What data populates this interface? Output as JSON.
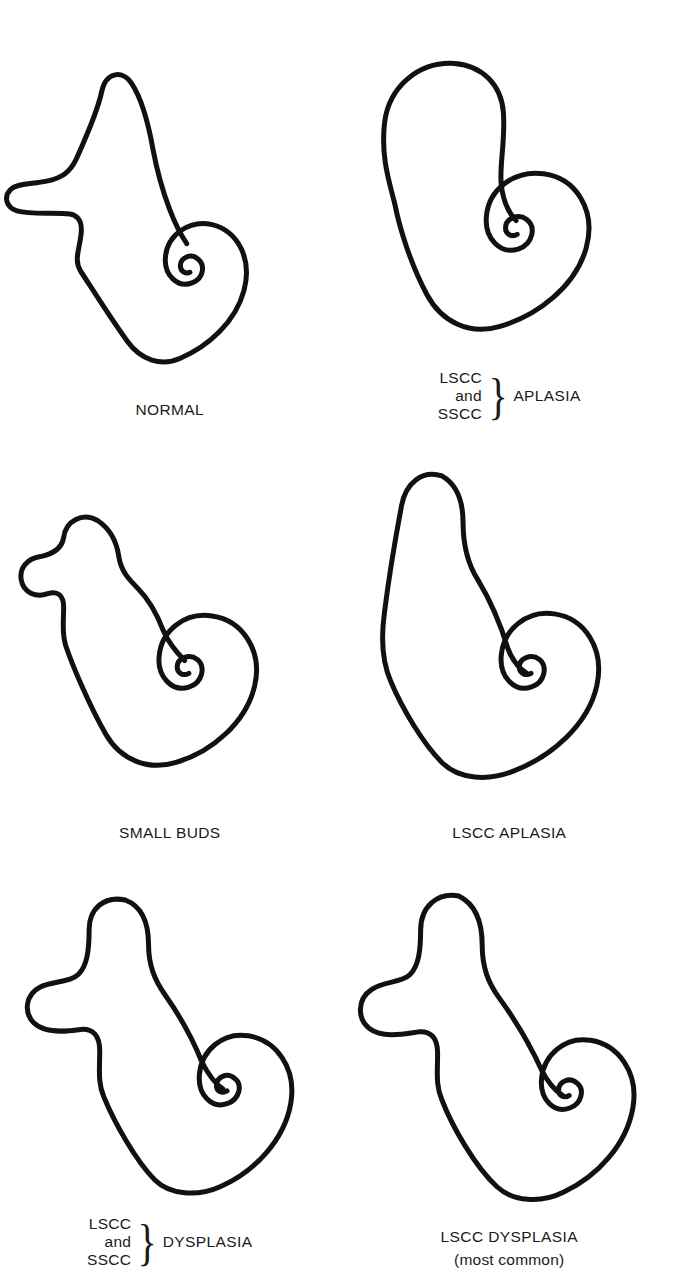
{
  "figure": {
    "type": "medical-anatomy-diagram",
    "background_color": "#ffffff",
    "line_color": "#111111",
    "columns": 2,
    "rows": 3
  },
  "panels": [
    {
      "id": "normal",
      "row": 1,
      "column": 1,
      "caption_style": "simple",
      "caption": "NORMAL",
      "features": {
        "sscc": "present, long vertical canal",
        "lscc": "present, long horizontal canal",
        "cochlea": "normal spiral, 2.5 turns"
      }
    },
    {
      "id": "lscc-sscc-aplasia",
      "row": 1,
      "column": 2,
      "caption_style": "braced",
      "brace_lines": [
        "LSCC",
        "and",
        "SSCC"
      ],
      "brace_glyph": "}",
      "brace_term": "APLASIA",
      "features": {
        "sscc": "absent",
        "lscc": "absent",
        "cochlea": "normal spiral, 2.5 turns"
      }
    },
    {
      "id": "small-buds",
      "row": 2,
      "column": 1,
      "caption_style": "simple",
      "caption": "SMALL BUDS",
      "features": {
        "sscc": "small bud only",
        "lscc": "small bud only",
        "cochlea": "normal spiral, 2.5 turns"
      }
    },
    {
      "id": "lscc-aplasia",
      "row": 2,
      "column": 2,
      "caption_style": "simple",
      "caption": "LSCC APLASIA",
      "features": {
        "sscc": "present, long vertical canal",
        "lscc": "absent",
        "cochlea": "normal spiral, 2.5 turns"
      }
    },
    {
      "id": "lscc-sscc-dysplasia",
      "row": 3,
      "column": 1,
      "caption_style": "braced",
      "brace_lines": [
        "LSCC",
        "and",
        "SSCC"
      ],
      "brace_glyph": "}",
      "brace_term": "DYSPLASIA",
      "features": {
        "sscc": "short, blunt, dysplastic",
        "lscc": "short, blunt, dysplastic",
        "cochlea": "normal spiral, 2.5 turns"
      }
    },
    {
      "id": "lscc-dysplasia",
      "row": 3,
      "column": 2,
      "caption_style": "simple",
      "caption": "LSCC DYSPLASIA",
      "caption_sub": "(most common)",
      "features": {
        "sscc": "present, tall canal",
        "lscc": "short, blunt, dysplastic",
        "cochlea": "normal spiral, 2.5 turns"
      }
    }
  ]
}
